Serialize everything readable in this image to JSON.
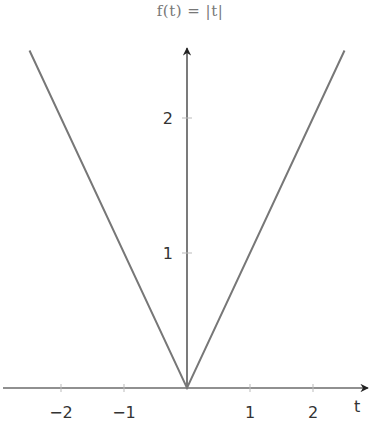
{
  "chart_data": {
    "type": "line",
    "title": "f(t) = |t|",
    "xlabel": "t",
    "ylabel": "",
    "xlim": [
      -2.9,
      2.9
    ],
    "ylim": [
      0,
      2.5
    ],
    "x_ticks": [
      -2,
      -1,
      1,
      2
    ],
    "x_tick_labels": [
      "−2",
      "−1",
      "1",
      "2"
    ],
    "y_ticks": [
      1,
      2
    ],
    "y_tick_labels": [
      "1",
      "2"
    ],
    "grid": false,
    "legend": null,
    "series": [
      {
        "name": "f(t) = |t|",
        "x": [
          -2.5,
          0,
          2.5
        ],
        "y": [
          2.5,
          0,
          2.5
        ],
        "color": "#777777"
      }
    ]
  },
  "axis_color": "#222222"
}
